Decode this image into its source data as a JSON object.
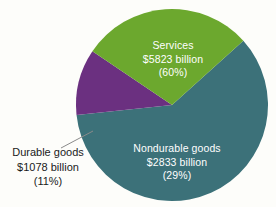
{
  "chart_data": {
    "type": "pie",
    "title": "",
    "subtitle": "",
    "xlabel": "",
    "ylabel": "",
    "legend_position": "none",
    "grid": false,
    "units": "billion dollars",
    "categories": [
      "Services",
      "Nondurable goods",
      "Durable goods"
    ],
    "values": [
      5823,
      2833,
      1078
    ],
    "percents": [
      60,
      29,
      11
    ],
    "colors": [
      "#3c7179",
      "#6ca82e",
      "#6b3080"
    ],
    "slices": [
      {
        "name": "Services",
        "label": "Services",
        "value": 5823,
        "value_text": "$5823 billion",
        "percent": 60,
        "percent_text": "(60%)",
        "color": "#3c7179",
        "label_color": "#ffffff",
        "label_placement": "inside",
        "start_angle": 318,
        "end_angle": 534
      },
      {
        "name": "Nondurable goods",
        "label": "Nondurable goods",
        "value": 2833,
        "value_text": "$2833 billion",
        "percent": 29,
        "percent_text": "(29%)",
        "color": "#6ca82e",
        "label_color": "#ffffff",
        "label_placement": "inside",
        "start_angle": 214,
        "end_angle": 318
      },
      {
        "name": "Durable goods",
        "label": "Durable goods",
        "value": 1078,
        "value_text": "$1078 billion",
        "percent": 11,
        "percent_text": "(11%)",
        "color": "#6b3080",
        "label_color": "#1a1a1a",
        "label_placement": "outside",
        "start_angle": 174,
        "end_angle": 214
      }
    ],
    "geometry": {
      "center_x": 172,
      "center_y": 105,
      "radius": 96
    },
    "background_color": "#fdfdfa",
    "leader_line_color": "#8a8a8a"
  }
}
